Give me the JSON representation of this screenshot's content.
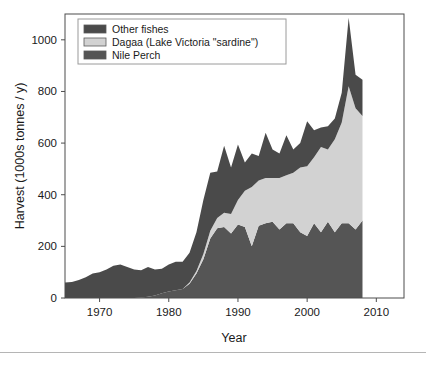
{
  "chart_data": {
    "type": "area",
    "stacked": true,
    "title": "",
    "xlabel": "Year",
    "ylabel": "Harvest (1000s tonnes / y)",
    "xlim": [
      1965,
      2014
    ],
    "ylim": [
      0,
      1100
    ],
    "xticks": [
      1970,
      1980,
      1990,
      2000,
      2010
    ],
    "yticks": [
      0,
      200,
      400,
      600,
      800,
      1000
    ],
    "grid": false,
    "legend_position": "top-left",
    "legend_entries": [
      "Other fishes",
      "Dagaa (Lake Victoria \"sardine\")",
      "Nile Perch"
    ],
    "colors": {
      "other_fishes": "#4a4a4a",
      "dagaa": "#d2d2d2",
      "nile_perch": "#555555",
      "axis": "#4d4d4d",
      "text": "#1a1a1a",
      "background": "#ffffff"
    },
    "x": [
      1965,
      1966,
      1967,
      1968,
      1969,
      1970,
      1971,
      1972,
      1973,
      1974,
      1975,
      1976,
      1977,
      1978,
      1979,
      1980,
      1981,
      1982,
      1983,
      1984,
      1985,
      1986,
      1987,
      1988,
      1989,
      1990,
      1991,
      1992,
      1993,
      1994,
      1995,
      1996,
      1997,
      1998,
      1999,
      2000,
      2001,
      2002,
      2003,
      2004,
      2005,
      2006,
      2007,
      2008,
      2009,
      2010,
      2011,
      2012,
      2013
    ],
    "series": [
      {
        "name": "Nile Perch",
        "values": [
          0,
          0,
          0,
          0,
          0,
          0,
          0,
          0,
          0,
          0,
          0,
          2,
          5,
          10,
          18,
          25,
          30,
          35,
          55,
          95,
          150,
          230,
          270,
          275,
          250,
          285,
          275,
          200,
          280,
          290,
          295,
          265,
          290,
          290,
          255,
          240,
          290,
          255,
          295,
          255,
          290,
          290,
          265,
          300,
          null,
          250,
          null,
          null,
          245
        ]
      },
      {
        "name": "Dagaa (Lake Victoria \"sardine\")",
        "values": [
          0,
          0,
          0,
          0,
          0,
          0,
          0,
          0,
          0,
          0,
          0,
          0,
          0,
          0,
          0,
          0,
          0,
          0,
          5,
          10,
          20,
          30,
          40,
          55,
          75,
          95,
          140,
          230,
          175,
          175,
          170,
          200,
          185,
          195,
          250,
          270,
          255,
          330,
          280,
          360,
          390,
          530,
          470,
          405,
          null,
          390,
          null,
          null,
          520
        ]
      },
      {
        "name": "Other fishes",
        "values": [
          60,
          62,
          70,
          80,
          95,
          100,
          110,
          125,
          130,
          120,
          110,
          105,
          115,
          100,
          95,
          105,
          110,
          105,
          115,
          150,
          210,
          225,
          180,
          260,
          180,
          215,
          110,
          130,
          95,
          175,
          110,
          95,
          155,
          90,
          95,
          175,
          105,
          75,
          90,
          80,
          115,
          265,
          130,
          140,
          null,
          210,
          null,
          null,
          85
        ]
      }
    ],
    "missing_data_years": [
      2009,
      2011,
      2012
    ],
    "peak": {
      "year": 2006,
      "total": 1085
    }
  }
}
